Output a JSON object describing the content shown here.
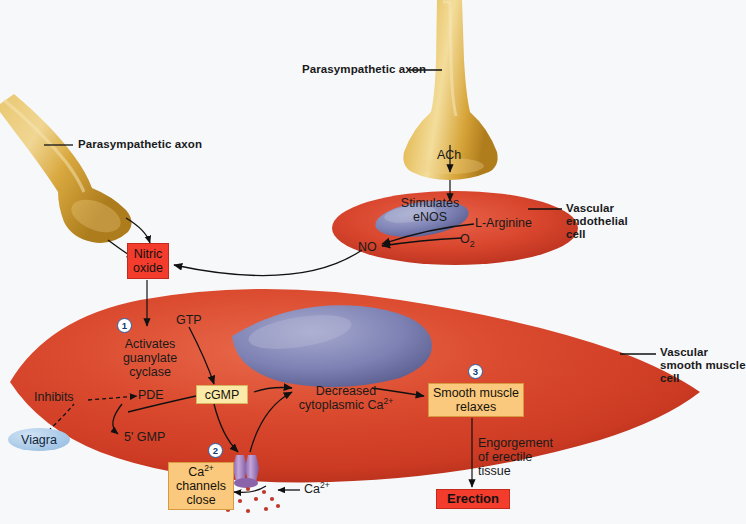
{
  "background_color": "#f7f8fa",
  "colors": {
    "red_box": "#f33c2c",
    "yellow_box": "#fceaa9",
    "orange_box": "#fbc97d",
    "axon": "#d8a43a",
    "smooth_muscle_cell": "#cf3a26",
    "endothelial_cell": "#d4422c",
    "nucleus": "#7b7fb5",
    "viagra_pill": "#a9c9e8",
    "number_circle_stroke": "#2a5fa8",
    "calcium_channel": "#9f79c0",
    "calcium_dot": "#c0392b"
  },
  "labels": {
    "parasympathetic_axon_top": "Parasympathetic axon",
    "parasympathetic_axon_left": "Parasympathetic axon",
    "ach": "ACh",
    "stimulates_enos_line1": "Stimulates",
    "stimulates_enos_line2": "eNOS",
    "l_arginine": "L-Arginine",
    "o2": "O",
    "o2_sub": "2",
    "no": "NO",
    "vascular_endothelial_cell_l1": "Vascular",
    "vascular_endothelial_cell_l2": "endothelial",
    "vascular_endothelial_cell_l3": "cell",
    "vascular_smooth_muscle_cell_l1": "Vascular",
    "vascular_smooth_muscle_cell_l2": "smooth muscle",
    "vascular_smooth_muscle_cell_l3": "cell",
    "gtp": "GTP",
    "activates_l1": "Activates",
    "activates_l2": "guanylate",
    "activates_l3": "cyclase",
    "inhibits": "Inhibits",
    "pde": "PDE",
    "five_gmp": "5' GMP",
    "viagra": "Viagra",
    "decreased_l1": "Decreased",
    "decreased_l2": "cytoplasmic Ca",
    "decreased_sup": "2+",
    "engorgement_l1": "Engorgement",
    "engorgement_l2": "of erectile",
    "engorgement_l3": "tissue",
    "calcium_ion": "Ca",
    "calcium_ion_sup": "2+"
  },
  "boxes": {
    "nitric_oxide": {
      "line1": "Nitric",
      "line2": "oxide",
      "style": "red"
    },
    "cgmp": {
      "text": "cGMP",
      "style": "yellow"
    },
    "ca_channels_close": {
      "line1": "Ca",
      "sup": "2+",
      "line2": "channels",
      "line3": "close",
      "style": "orange"
    },
    "smooth_muscle_relaxes": {
      "line1": "Smooth muscle",
      "line2": "relaxes",
      "style": "orange"
    },
    "erection": {
      "text": "Erection",
      "style": "red-bold"
    }
  },
  "step_numbers": [
    {
      "id": 1,
      "label": "1",
      "describes": "Activates guanylate cyclase"
    },
    {
      "id": 2,
      "label": "2",
      "describes": "Ca2+ channels close"
    },
    {
      "id": 3,
      "label": "3",
      "describes": "Smooth muscle relaxes"
    }
  ],
  "pathway_steps": [
    "Parasympathetic axon releases ACh",
    "ACh stimulates eNOS in vascular endothelial cell",
    "L-Arginine + O2 produce NO",
    "NO diffuses to vascular smooth muscle cell",
    "NO activates guanylate cyclase (step 1)",
    "GTP converted to cGMP",
    "cGMP closes Ca2+ channels (step 2)",
    "Decreased cytoplasmic Ca2+",
    "Smooth muscle relaxes (step 3)",
    "Engorgement of erectile tissue leads to Erection",
    "PDE degrades cGMP to 5' GMP; Viagra inhibits PDE"
  ]
}
